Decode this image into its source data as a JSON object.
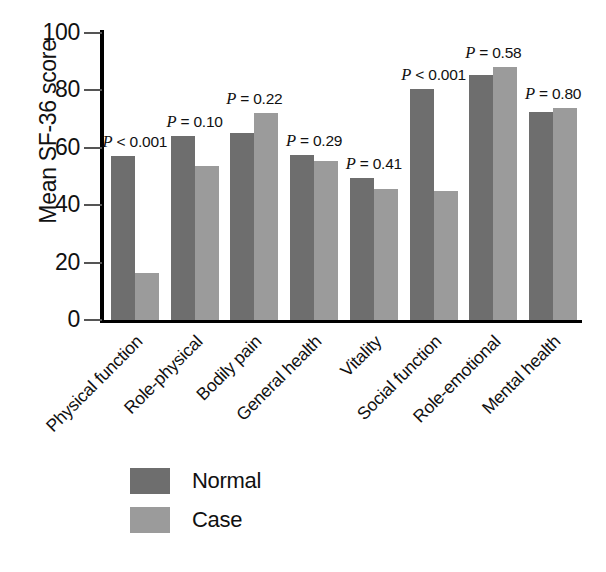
{
  "chart_data": {
    "type": "bar",
    "title": "",
    "subtitle": "",
    "xlabel": "",
    "ylabel": "Mean SF-36 score",
    "ylim": [
      0,
      100
    ],
    "yticks": [
      0,
      20,
      40,
      60,
      80,
      100
    ],
    "ytick_labels": [
      "0",
      "20",
      "40",
      "60",
      "80",
      "100"
    ],
    "grid": false,
    "legend_position": "bottom-left",
    "categories": [
      "Physical function",
      "Role-physical",
      "Bodily pain",
      "General health",
      "Vitality",
      "Social function",
      "Role-emotional",
      "Mental health"
    ],
    "series": [
      {
        "name": "Normal",
        "color": "#6e6e6e",
        "values": [
          57,
          64,
          65,
          57.5,
          49.5,
          80.5,
          85.5,
          72.5
        ]
      },
      {
        "name": "Case",
        "color": "#9b9b9b",
        "values": [
          16.5,
          53.5,
          72,
          55.5,
          45.5,
          45,
          88,
          74
        ]
      }
    ],
    "annotations": [
      {
        "category": "Physical function",
        "prefix": "P",
        "text": " < 0.001"
      },
      {
        "category": "Role-physical",
        "prefix": "P",
        "text": " = 0.10"
      },
      {
        "category": "Bodily pain",
        "prefix": "P",
        "text": " = 0.22"
      },
      {
        "category": "General health",
        "prefix": "P",
        "text": " = 0.29"
      },
      {
        "category": "Vitality",
        "prefix": "P",
        "text": " = 0.41"
      },
      {
        "category": "Social function",
        "prefix": "P",
        "text": " < 0.001"
      },
      {
        "category": "Role-emotional",
        "prefix": "P",
        "text": " = 0.58"
      },
      {
        "category": "Mental health",
        "prefix": "P",
        "text": " = 0.80"
      }
    ]
  },
  "legend": {
    "items": [
      {
        "label": "Normal",
        "color": "#6e6e6e"
      },
      {
        "label": "Case",
        "color": "#9b9b9b"
      }
    ]
  },
  "colors": {
    "normal": "#6e6e6e",
    "case": "#9b9b9b",
    "axis": "#000000",
    "text": "#111111",
    "background": "#ffffff"
  }
}
